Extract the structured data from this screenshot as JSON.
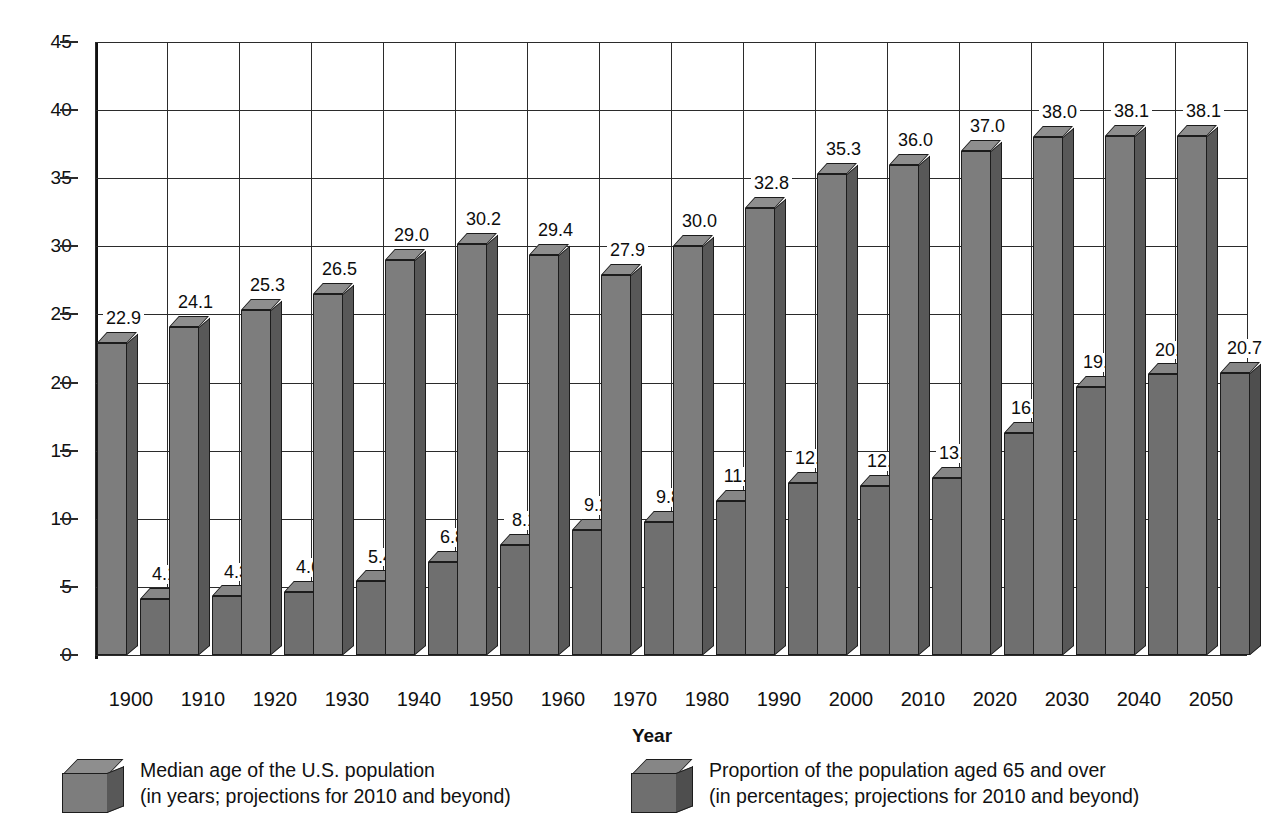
{
  "chart_data": {
    "type": "bar",
    "title": "",
    "xlabel": "Year",
    "ylabel": "",
    "ylim": [
      0,
      45
    ],
    "ytick_step": 5,
    "grid": true,
    "legend_position": "bottom",
    "style": "3d-column",
    "categories": [
      "1900",
      "1910",
      "1920",
      "1930",
      "1940",
      "1950",
      "1960",
      "1970",
      "1980",
      "1990",
      "2000",
      "2010",
      "2020",
      "2030",
      "2040",
      "2050"
    ],
    "series": [
      {
        "name": "Median age of the U.S. population",
        "values": [
          22.9,
          24.1,
          25.3,
          26.5,
          29.0,
          30.2,
          29.4,
          27.9,
          30.0,
          32.8,
          35.3,
          36.0,
          37.0,
          38.0,
          38.1,
          38.1
        ],
        "labels": [
          "22.9",
          "24.1",
          "25.3",
          "26.5",
          "29.0",
          "30.2",
          "29.4",
          "27.9",
          "30.0",
          "32.8",
          "35.3",
          "36.0",
          "37.0",
          "38.0",
          "38.1",
          "38.1"
        ],
        "color": "#7d7d7d",
        "side_color": "#585858",
        "top_color": "#8e8e8e"
      },
      {
        "name": "Proportion of the population aged 65 and over",
        "values": [
          4.1,
          4.3,
          4.6,
          5.4,
          6.8,
          8.1,
          9.2,
          9.8,
          11.3,
          12.6,
          12.4,
          13.0,
          16.3,
          19.7,
          20.6,
          20.7
        ],
        "labels": [
          "4.1",
          "4.3",
          "4.6",
          "5.4",
          "6.8",
          "8.1",
          "9.2",
          "9.8",
          "11.3",
          "12.6",
          "12.4",
          "13.0",
          "16.3",
          "19.7",
          "20.6",
          "20.7"
        ],
        "color": "#6f6f6f",
        "side_color": "#4e4e4e",
        "top_color": "#868686"
      }
    ],
    "ytick_labels": [
      "45",
      "40",
      "35",
      "30",
      "25",
      "20",
      "15",
      "10",
      "5",
      "0"
    ],
    "legend": [
      {
        "line1": "Median age of the U.S. population",
        "line2": "(in years; projections for 2010 and beyond)",
        "swatch": "cube-light-gray"
      },
      {
        "line1": "Proportion of the population aged 65 and over",
        "line2": "(in percentages; projections for 2010 and beyond)",
        "swatch": "cube-dark-gray"
      }
    ]
  },
  "axis": {
    "x_title": "Year"
  }
}
